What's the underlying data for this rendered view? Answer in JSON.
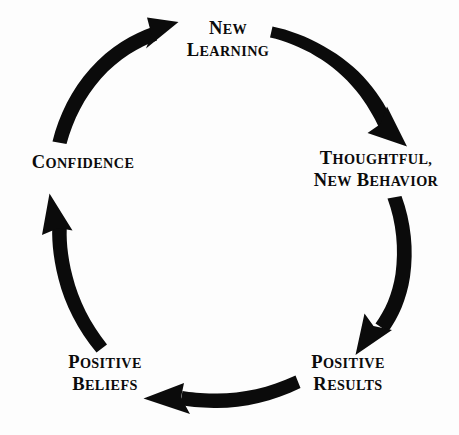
{
  "diagram": {
    "type": "cycle-diagram",
    "background_color": "#fdfdfd",
    "stroke_color": "#0b0b0b",
    "text_color": "#0b0b0b",
    "direction": "clockwise",
    "nodes": [
      {
        "id": "new-learning",
        "lines": [
          "New",
          "Learning"
        ],
        "position": "top",
        "order": 1
      },
      {
        "id": "thoughtful-new-behavior",
        "lines": [
          "Thoughtful,",
          "New Behavior"
        ],
        "position": "right",
        "order": 2
      },
      {
        "id": "positive-results",
        "lines": [
          "Positive",
          "Results"
        ],
        "position": "bottom-right",
        "order": 3
      },
      {
        "id": "positive-beliefs",
        "lines": [
          "Positive",
          "Beliefs"
        ],
        "position": "bottom-left",
        "order": 4
      },
      {
        "id": "confidence",
        "lines": [
          "Confidence"
        ],
        "position": "left",
        "order": 5
      }
    ],
    "arrows": [
      {
        "id": "arrow-new-learning-to-behavior",
        "from": "new-learning",
        "to": "thoughtful-new-behavior",
        "label": "new-learning-to-thoughtful-new-behavior"
      },
      {
        "id": "arrow-behavior-to-results",
        "from": "thoughtful-new-behavior",
        "to": "positive-results",
        "label": "thoughtful-new-behavior-to-positive-results"
      },
      {
        "id": "arrow-results-to-beliefs",
        "from": "positive-results",
        "to": "positive-beliefs",
        "label": "positive-results-to-positive-beliefs"
      },
      {
        "id": "arrow-beliefs-to-confidence",
        "from": "positive-beliefs",
        "to": "confidence",
        "label": "positive-beliefs-to-confidence"
      },
      {
        "id": "arrow-confidence-to-new-learning",
        "from": "confidence",
        "to": "new-learning",
        "label": "confidence-to-new-learning"
      }
    ]
  }
}
